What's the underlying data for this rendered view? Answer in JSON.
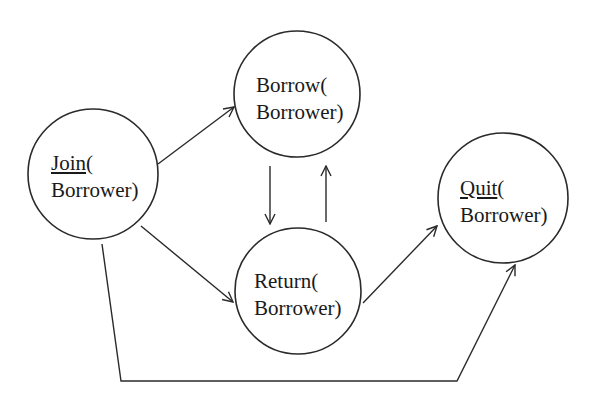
{
  "diagram": {
    "type": "state-transition",
    "nodes": [
      {
        "id": "join",
        "name": "Join",
        "underlined": true,
        "line1_suffix": "(",
        "line2": "Borrower)"
      },
      {
        "id": "borrow",
        "name": "Borrow",
        "underlined": false,
        "line1_suffix": "(",
        "line2": "Borrower)"
      },
      {
        "id": "return",
        "name": "Return",
        "underlined": false,
        "line1_suffix": "(",
        "line2": "Borrower)"
      },
      {
        "id": "quit",
        "name": "Quit",
        "underlined": true,
        "line1_suffix": "(",
        "line2": "Borrower)"
      }
    ],
    "edges": [
      {
        "from": "join",
        "to": "borrow"
      },
      {
        "from": "join",
        "to": "return"
      },
      {
        "from": "borrow",
        "to": "return"
      },
      {
        "from": "return",
        "to": "borrow"
      },
      {
        "from": "return",
        "to": "quit"
      },
      {
        "from": "join",
        "to": "quit"
      }
    ],
    "colors": {
      "stroke": "#2a2a2a",
      "text": "#1a1a1a",
      "background": "#ffffff"
    }
  }
}
